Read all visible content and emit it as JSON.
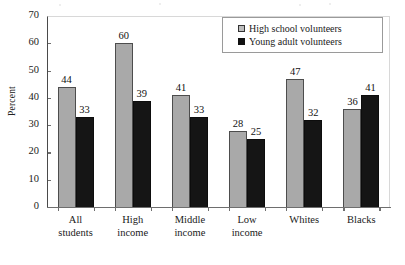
{
  "chart_data": {
    "type": "bar",
    "title": "",
    "subtitle": "",
    "xlabel": "",
    "ylabel": "Percent",
    "categories": [
      "All students",
      "High income",
      "Middle income",
      "Low income",
      "Whites",
      "Blacks"
    ],
    "category_lines": [
      [
        "All",
        "students"
      ],
      [
        "High",
        "income"
      ],
      [
        "Middle",
        "income"
      ],
      [
        "Low",
        "income"
      ],
      [
        "Whites",
        ""
      ],
      [
        "Blacks",
        ""
      ]
    ],
    "series": [
      {
        "name": "High school volunteers",
        "color": "#a9a9a9",
        "values": [
          44,
          60,
          41,
          28,
          47,
          36
        ]
      },
      {
        "name": "Young adult volunteers",
        "color": "#151515",
        "values": [
          33,
          39,
          33,
          25,
          32,
          41
        ]
      }
    ],
    "ylim": [
      0,
      70
    ],
    "ytick_values": [
      70,
      60,
      50,
      40,
      30,
      20,
      10,
      0
    ],
    "ytick_labels": [
      "70",
      "60",
      "50",
      "40",
      "30",
      "20",
      "10",
      "0"
    ],
    "grid": false,
    "legend_position": "top-right",
    "data_labels": true
  },
  "legend": {
    "items": [
      {
        "label": "High school volunteers",
        "swatch": "gray"
      },
      {
        "label": "Young adult volunteers",
        "swatch": "black"
      }
    ]
  }
}
